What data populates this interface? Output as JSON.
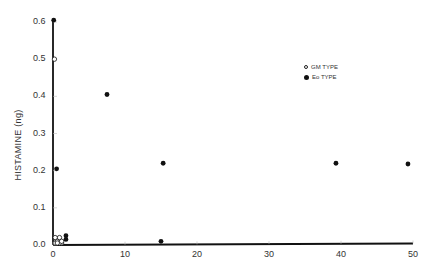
{
  "chart_data": {
    "type": "scatter",
    "title": "",
    "xlabel": "",
    "ylabel": "HISTAMINE (ng)",
    "xlim": [
      0,
      50
    ],
    "ylim": [
      0,
      0.6
    ],
    "x_ticks": [
      0,
      10,
      20,
      30,
      40,
      50
    ],
    "x_tick_labels": [
      "0",
      "10",
      "20",
      "30",
      "40",
      "50"
    ],
    "y_ticks": [
      0.0,
      0.1,
      0.2,
      0.3,
      0.4,
      0.5,
      0.6
    ],
    "y_tick_labels": [
      "0.0",
      "0.1",
      "0.2",
      "0.3",
      "0.4",
      "0.5",
      "0.6"
    ],
    "grid": false,
    "legend_position": "upper right",
    "series": [
      {
        "name": "GM TYPE",
        "marker": "open-circle",
        "points": [
          {
            "x": 0.2,
            "y": 0.5
          },
          {
            "x": 0.3,
            "y": 0.0
          },
          {
            "x": 0.6,
            "y": 0.01
          },
          {
            "x": 0.9,
            "y": 0.02
          },
          {
            "x": 1.2,
            "y": 0.0
          },
          {
            "x": 0.3,
            "y": 0.02
          },
          {
            "x": 0.9,
            "y": 0.0
          },
          {
            "x": 1.2,
            "y": 0.01
          },
          {
            "x": 0.6,
            "y": 0.0
          }
        ]
      },
      {
        "name": "Eo TYPE",
        "marker": "filled-circle",
        "points": [
          {
            "x": 0.1,
            "y": 0.605
          },
          {
            "x": 0.5,
            "y": 0.205
          },
          {
            "x": 1.8,
            "y": 0.025
          },
          {
            "x": 1.8,
            "y": 0.015
          },
          {
            "x": 7.5,
            "y": 0.405
          },
          {
            "x": 15.3,
            "y": 0.22
          },
          {
            "x": 15.0,
            "y": 0.01
          },
          {
            "x": 39.3,
            "y": 0.22
          },
          {
            "x": 49.3,
            "y": 0.218
          }
        ]
      }
    ]
  },
  "legend": {
    "items": [
      {
        "label": "GM TYPE",
        "marker": "open-circle"
      },
      {
        "label": "Eo TYPE",
        "marker": "filled-circle"
      }
    ]
  },
  "axes": {
    "ylabel": "HISTAMINE (ng)"
  },
  "colors": {
    "axis": "#111111",
    "marker": "#111111",
    "background": "#ffffff"
  }
}
